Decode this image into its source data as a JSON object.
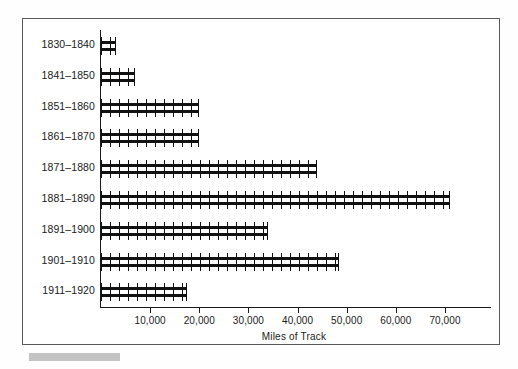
{
  "chart_data": {
    "type": "bar",
    "orientation": "horizontal",
    "title": "",
    "xlabel": "Miles of Track",
    "ylabel": "",
    "categories": [
      "1830–1840",
      "1841–1850",
      "1851–1860",
      "1861–1870",
      "1871–1880",
      "1881–1890",
      "1891–1900",
      "1901–1910",
      "1911–1920"
    ],
    "values": [
      3000,
      7000,
      20000,
      20000,
      44000,
      71000,
      34000,
      48500,
      17500
    ],
    "xlim": [
      0,
      79000
    ],
    "xticks": [
      10000,
      20000,
      30000,
      40000,
      50000,
      60000,
      70000
    ],
    "xticklabels": [
      "10,000",
      "20,000",
      "30,000",
      "40,000",
      "50,000",
      "60,000",
      "70,000"
    ],
    "grid": false,
    "legend": false,
    "bar_style": "railroad-track",
    "bar_color": "#111111"
  },
  "figure": {
    "border_color": "#58595b",
    "background": "#ffffff",
    "axis_color": "#1a1a1a"
  },
  "caption_strip": {
    "color": "#b9b9b9"
  }
}
